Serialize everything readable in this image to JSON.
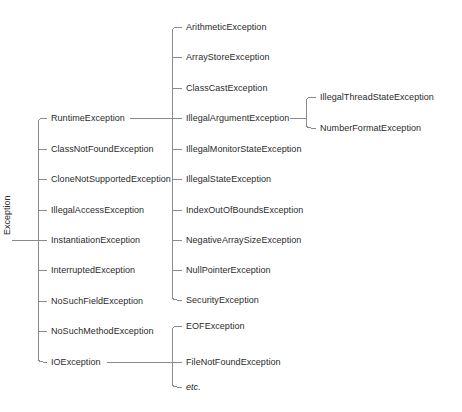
{
  "diagram": {
    "background_color": "#ffffff",
    "line_color": "#8a8a8a",
    "text_color": "#2b2b2b",
    "root": {
      "label": "Exception",
      "trunk_x": 38,
      "label_x": 22,
      "label_center_y": 240,
      "trunk_top": 118,
      "trunk_bottom": 362,
      "stub_x": 12
    },
    "columns": {
      "level1_text_x": 51,
      "level1_stub_start": 38,
      "level2_trunk_x": 172,
      "level2_text_x": 186,
      "level3_trunk_x": 306,
      "level3_text_x": 320
    },
    "level1": [
      {
        "label": "RuntimeException",
        "y": 118,
        "has_child_trunk": true
      },
      {
        "label": "ClassNotFoundException",
        "y": 149,
        "has_child_trunk": false
      },
      {
        "label": "CloneNotSupportedException",
        "y": 179,
        "has_child_trunk": false
      },
      {
        "label": "IllegalAccessException",
        "y": 210,
        "has_child_trunk": false
      },
      {
        "label": "InstantiationException",
        "y": 240,
        "has_child_trunk": false
      },
      {
        "label": "InterruptedException",
        "y": 270,
        "has_child_trunk": false
      },
      {
        "label": "NoSuchFieldException",
        "y": 301,
        "has_child_trunk": false
      },
      {
        "label": "NoSuchMethodException",
        "y": 331,
        "has_child_trunk": false
      },
      {
        "label": "IOException",
        "y": 362,
        "has_child_trunk": true
      }
    ],
    "runtime_children": {
      "parent": "RuntimeException",
      "trunk_x": 172,
      "trunk_top": 27,
      "trunk_bottom": 300,
      "items": [
        {
          "label": "ArithmeticException",
          "y": 27,
          "has_child_trunk": false
        },
        {
          "label": "ArrayStoreException",
          "y": 57,
          "has_child_trunk": false
        },
        {
          "label": "ClassCastException",
          "y": 88,
          "has_child_trunk": false
        },
        {
          "label": "IllegalArgumentException",
          "y": 118,
          "has_child_trunk": true
        },
        {
          "label": "IllegalMonitorStateException",
          "y": 149,
          "has_child_trunk": false
        },
        {
          "label": "IllegalStateException",
          "y": 179,
          "has_child_trunk": false
        },
        {
          "label": "IndexOutOfBoundsException",
          "y": 210,
          "has_child_trunk": false
        },
        {
          "label": "NegativeArraySizeException",
          "y": 240,
          "has_child_trunk": false
        },
        {
          "label": "NullPointerException",
          "y": 270,
          "has_child_trunk": false
        },
        {
          "label": "SecurityException",
          "y": 300,
          "has_child_trunk": false
        }
      ]
    },
    "illegal_argument_children": {
      "parent": "IllegalArgumentException",
      "trunk_x": 306,
      "trunk_top": 97,
      "trunk_bottom": 128,
      "items": [
        {
          "label": "IllegalThreadStateException",
          "y": 97
        },
        {
          "label": "NumberFormatException",
          "y": 128
        }
      ]
    },
    "io_children": {
      "parent": "IOException",
      "trunk_x": 172,
      "trunk_top": 326,
      "trunk_bottom": 387,
      "items": [
        {
          "label": "EOFException",
          "y": 326,
          "italic": false
        },
        {
          "label": "FileNotFoundException",
          "y": 362,
          "italic": false
        },
        {
          "label": "etc.",
          "y": 387,
          "italic": true
        }
      ]
    }
  }
}
